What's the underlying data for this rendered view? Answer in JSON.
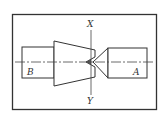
{
  "diagram": {
    "type": "mechanical-coupling-alignment",
    "labels": {
      "axis_top": "X",
      "axis_bottom": "Y",
      "left_shaft": "B",
      "right_shaft": "A"
    },
    "colors": {
      "stroke": "#333333",
      "background": "#ffffff"
    }
  }
}
